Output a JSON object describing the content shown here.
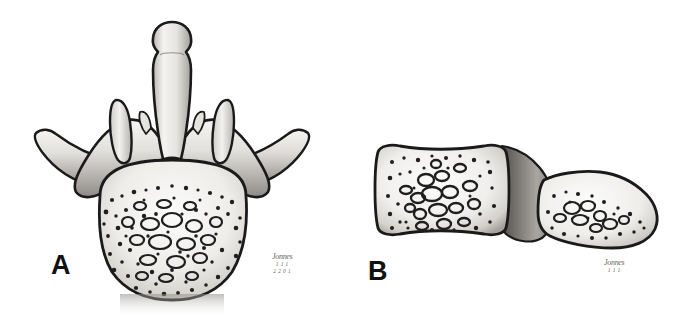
{
  "figure": {
    "background_color": "#ffffff",
    "width": 688,
    "height": 317,
    "style": "grayscale pen-and-ink stipple medical illustration"
  },
  "panels": [
    {
      "id": "A",
      "label": "A",
      "view": "superior (axial) view of lumbar vertebra",
      "structures": [
        "spinous process",
        "superior articular processes",
        "transverse processes",
        "vertebral foramen",
        "pedicles",
        "laminae",
        "vertebral body with trabecular bone"
      ],
      "signature": {
        "name": "Jonnes",
        "sub": "1 1 1",
        "sub2": "2 2 0 1"
      }
    },
    {
      "id": "B",
      "label": "B",
      "view": "lateral (sagittal) view of two vertebral bodies",
      "structures": [
        "normal vertebral body",
        "intervertebral disc",
        "wedge-compressed vertebral body",
        "trabecular bone pattern"
      ],
      "signature": {
        "name": "Jonnes",
        "sub": "1 1 1",
        "sub2": ""
      }
    }
  ],
  "colors": {
    "outline": "#1a1a1a",
    "bone_light": "#f2f1ef",
    "bone_mid": "#cfcdc9",
    "bone_shadow": "#9b9893",
    "disc_dark": "#6e6b67",
    "background": "#ffffff",
    "label_text": "#111111",
    "signature_text": "#4a4a4a"
  }
}
